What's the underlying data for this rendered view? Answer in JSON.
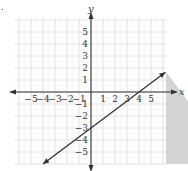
{
  "chart_data": {
    "type": "line",
    "title": "",
    "xlabel": "x",
    "ylabel": "y",
    "xlim": [
      -6,
      6
    ],
    "ylim": [
      -6,
      6
    ],
    "grid": true,
    "x_ticks": [
      "-5",
      "-4",
      "-3",
      "-2",
      "-1",
      "1",
      "2",
      "3",
      "4",
      "5"
    ],
    "y_ticks": [
      "5",
      "4",
      "3",
      "2",
      "1",
      "-1",
      "-2",
      "-3",
      "-4",
      "-5"
    ],
    "series": [
      {
        "name": "boundary line",
        "equation": "y = (3/4)x - 3",
        "style": "solid",
        "points": [
          [
            -4,
            -6
          ],
          [
            0,
            -3
          ],
          [
            4,
            0
          ],
          [
            6.2,
            1.65
          ]
        ]
      }
    ],
    "shaded_region": "below line (y <= (3/4)x - 3)",
    "inequality": "y ≤ (3/4)x − 3",
    "colors": {
      "shade": "#d4d4d4",
      "line": "#333333",
      "grid": "#e2e2e2",
      "axis": "#333333"
    }
  },
  "labels": {
    "x_axis": "x",
    "y_axis": "y",
    "bullet": "."
  }
}
